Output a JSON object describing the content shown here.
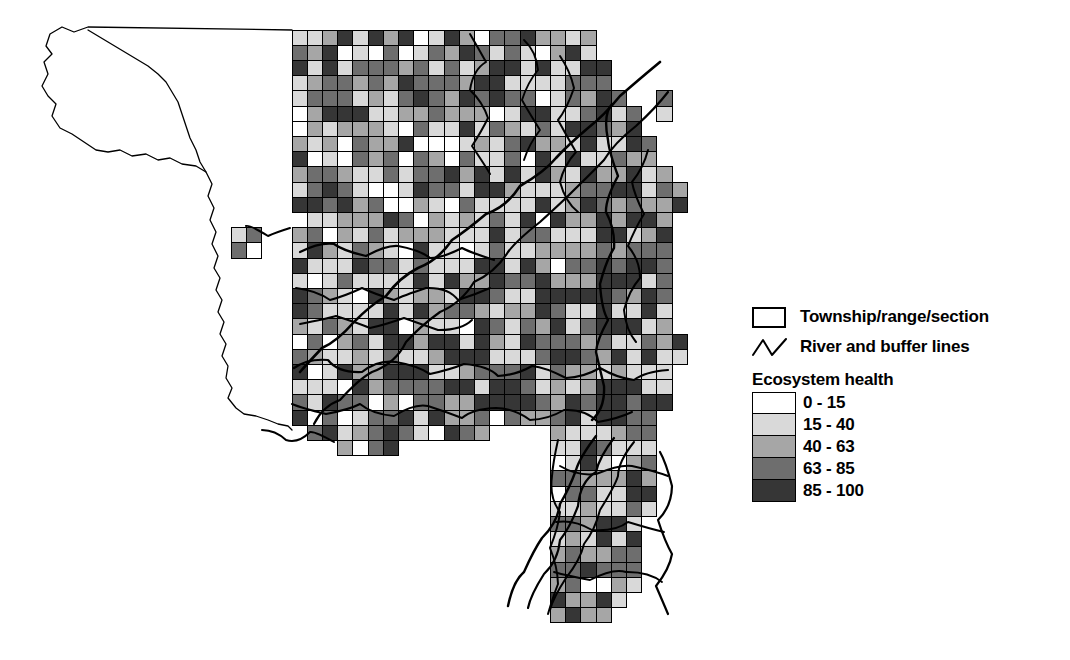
{
  "map": {
    "title": "Ecosystem health by township/range/section",
    "county_outline_name": "county-boundary",
    "grid": {
      "origin_x": 292,
      "origin_y": 30,
      "cell": 15.2,
      "cols": 25,
      "rows": 39
    },
    "palette": [
      "#ffffff",
      "#d9d9d9",
      "#a6a6a6",
      "#6e6e6e",
      "#363636"
    ],
    "stroke": "#000000",
    "river_color": "#000000"
  },
  "legend": {
    "items": [
      {
        "symbol": "rectangle-outline",
        "label": "Township/range/section"
      },
      {
        "symbol": "zigzag-line",
        "label": "River and buffer lines"
      }
    ],
    "ramp_title": "Ecosystem health",
    "ramp": [
      {
        "label": "0 - 15",
        "color": "#ffffff"
      },
      {
        "label": "15 - 40",
        "color": "#d9d9d9"
      },
      {
        "label": "40 - 63",
        "color": "#a6a6a6"
      },
      {
        "label": "63 - 85",
        "color": "#6e6e6e"
      },
      {
        "label": "85 - 100",
        "color": "#363636"
      }
    ]
  },
  "chart_data": {
    "type": "heatmap",
    "title": "Ecosystem health",
    "xlabel": "",
    "ylabel": "",
    "legend_position": "right",
    "grid": true,
    "classes": [
      {
        "name": "0 - 15",
        "min": 0,
        "max": 15,
        "color": "#ffffff"
      },
      {
        "name": "15 - 40",
        "min": 15,
        "max": 40,
        "color": "#d9d9d9"
      },
      {
        "name": "40 - 63",
        "min": 40,
        "max": 63,
        "color": "#a6a6a6"
      },
      {
        "name": "63 - 85",
        "min": 63,
        "max": 85,
        "color": "#6e6e6e"
      },
      {
        "name": "85 - 100",
        "min": 85,
        "max": 100,
        "color": "#363636"
      }
    ],
    "cell_class_rows": [
      "..0434041401340023144..",
      "..1041404013400231443..",
      "..4104140401340023144.4",
      "..0414043140024314403.4",
      ".44140431400243144034.4",
      ".41403140024314403440.4",
      ".14031400243144034404.4",
      "41403140024314403440444",
      "14031400243144034404443",
      "40314002431440344044431",
      "03140024314403440444314",
      "31400243144034404443140",
      "14002431440344044431403",
      "40024314403440444314031",
      "00243144034404443140314",
      "02431440344044431403140",
      "24314403440444314031400",
      "43144034404443140314002",
      "31440344044431403140024",
      "14403440444314031400243",
      "44034404443140314002431",
      "40344044431403140024314",
      "03440444314031400243144",
      "34404443140314002431440",
      "44044431403140024314403",
      "40444314031400243144034",
      "04443140314002431440344",
      "44431403140024314403440",
      "44314031400243144034404",
      "43140314002431440344044",
      "31403140024314403440444",
      "14031400243144034404443",
      "40314002431440344044431",
      "03140024314403440444314",
      "31400243144034404443140",
      "14002431440344044431403",
      "40024314403440444314031",
      "00243144034404443140314",
      "02431440344044431403140"
    ]
  }
}
